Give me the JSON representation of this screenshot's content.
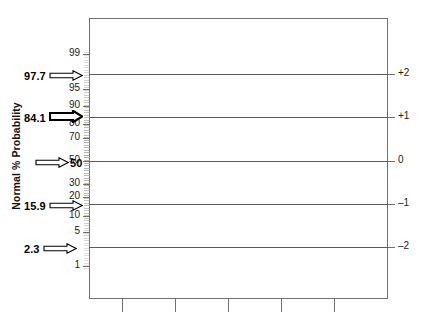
{
  "chart_data": {
    "type": "line",
    "title": "",
    "subtitle": "",
    "ylabel": "Normal % Probability",
    "y2label": "Standard Deviations (from mean)",
    "xlabel": "",
    "grid": true,
    "legend": "none",
    "y_ticks_left": [
      "99",
      "95",
      "90",
      "80",
      "70",
      "50",
      "30",
      "20",
      "10",
      "5",
      "1"
    ],
    "y_ticks_right": [
      "+2",
      "+1",
      "0",
      "–1",
      "–2"
    ],
    "x_ticks": [
      "",
      "",
      "",
      "",
      ""
    ],
    "ylim": [
      1,
      99
    ],
    "y2lim": [
      -2.5,
      2.5
    ],
    "series": [
      {
        "name": "Standard deviation reference lines",
        "x": [
          0,
          1
        ],
        "points": [
          {
            "sd": "+2",
            "percent": "97.7"
          },
          {
            "sd": "+1",
            "percent": "84.1"
          },
          {
            "sd": "0",
            "percent": "50"
          },
          {
            "sd": "–1",
            "percent": "15.9"
          },
          {
            "sd": "–2",
            "percent": "2.3"
          }
        ]
      }
    ],
    "annotations": [
      {
        "label": "97.7",
        "sd": "+2",
        "style": "thin-arrow",
        "side": "left"
      },
      {
        "label": "84.1",
        "sd": "+1",
        "style": "bold-arrow",
        "side": "left"
      },
      {
        "label": "50",
        "sd": "0",
        "style": "thin-arrow",
        "side": "left"
      },
      {
        "label": "15.9",
        "sd": "–1",
        "style": "thin-arrow",
        "side": "left"
      },
      {
        "label": "2.3",
        "sd": "–2",
        "style": "thin-arrow",
        "side": "left"
      }
    ]
  },
  "axes": {
    "left": {
      "title": "Normal % Probability",
      "ticks": [
        {
          "label": "99",
          "y": 54
        },
        {
          "label": "95",
          "y": 89
        },
        {
          "label": "90",
          "y": 106
        },
        {
          "label": "80",
          "y": 124
        },
        {
          "label": "70",
          "y": 138
        },
        {
          "label": "50",
          "y": 161
        },
        {
          "label": "30",
          "y": 184
        },
        {
          "label": "20",
          "y": 197
        },
        {
          "label": "10",
          "y": 216
        },
        {
          "label": "5",
          "y": 232
        },
        {
          "label": "1",
          "y": 266
        }
      ]
    },
    "right": {
      "title": "Standard Deviations (from mean)",
      "ticks": [
        {
          "label": "+2",
          "y": 74
        },
        {
          "label": "+1",
          "y": 117
        },
        {
          "label": "0",
          "y": 161
        },
        {
          "label": "–1",
          "y": 204
        },
        {
          "label": "–2",
          "y": 247
        }
      ]
    },
    "bottom": {
      "ticks": [
        {
          "label": "",
          "x": 122
        },
        {
          "label": "",
          "x": 175
        },
        {
          "label": "",
          "x": 228
        },
        {
          "label": "",
          "x": 281
        },
        {
          "label": "",
          "x": 334
        }
      ]
    }
  },
  "gridlines": [
    {
      "y": 74
    },
    {
      "y": 117
    },
    {
      "y": 161
    },
    {
      "y": 204
    },
    {
      "y": 247
    }
  ],
  "callouts": [
    {
      "value": "97.7",
      "y": 74,
      "weight": "thin",
      "label_side": "left"
    },
    {
      "value": "84.1",
      "y": 117,
      "weight": "bold",
      "label_side": "left"
    },
    {
      "value": "50",
      "y": 161,
      "weight": "thin",
      "label_side": "right"
    },
    {
      "value": "15.9",
      "y": 204,
      "weight": "thin",
      "label_side": "left"
    },
    {
      "value": "2.3",
      "y": 247,
      "weight": "thin",
      "label_side": "left"
    }
  ],
  "colors": {
    "frame": "#6f6f6f",
    "gridline": "#5b5b5b",
    "text": "#1a1a1a",
    "minor_tick": "#9a9a9a",
    "background": "#ffffff"
  }
}
